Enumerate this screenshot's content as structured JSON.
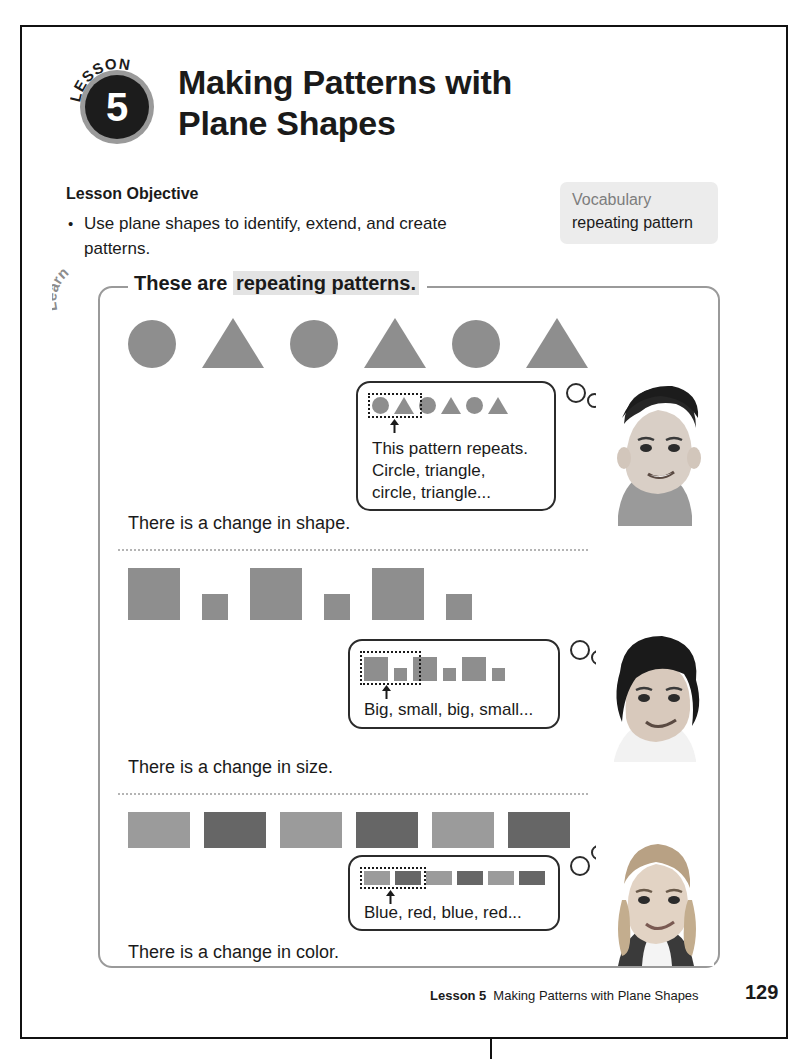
{
  "page": {
    "number": "129",
    "footer_lesson": "Lesson 5",
    "footer_title": "Making Patterns with Plane Shapes"
  },
  "header": {
    "badge_word": "LESSON",
    "badge_number": "5",
    "title_line1": "Making Patterns with",
    "title_line2": "Plane Shapes"
  },
  "objective": {
    "heading": "Lesson Objective",
    "bullet": "•",
    "text": "Use plane shapes to identify, extend, and create patterns."
  },
  "vocabulary": {
    "title": "Vocabulary",
    "term": "repeating pattern"
  },
  "learn": {
    "tab_label": "Learn",
    "heading_plain": "These are ",
    "heading_highlight": "repeating patterns."
  },
  "patterns": [
    {
      "id": "shape-pattern",
      "sequence": [
        "circle",
        "triangle",
        "circle",
        "triangle",
        "circle",
        "triangle"
      ],
      "caption": "There is a change in shape.",
      "bubble_lines": [
        "This pattern repeats.",
        "Circle, triangle,",
        "circle, triangle..."
      ],
      "mini_sequence": [
        "circle",
        "triangle",
        "circle",
        "triangle",
        "circle",
        "triangle"
      ],
      "unit_count": 2
    },
    {
      "id": "size-pattern",
      "sequence": [
        "big",
        "small",
        "big",
        "small",
        "big",
        "small"
      ],
      "caption": "There is a change in size.",
      "bubble_lines": [
        "Big, small, big, small..."
      ],
      "mini_sequence": [
        "big",
        "small",
        "big",
        "small",
        "big",
        "small"
      ],
      "unit_count": 2
    },
    {
      "id": "color-pattern",
      "sequence": [
        "blue",
        "red",
        "blue",
        "red",
        "blue",
        "red"
      ],
      "caption": "There is a change in color.",
      "bubble_lines": [
        "Blue, red, blue, red..."
      ],
      "mini_sequence": [
        "blue",
        "red",
        "blue",
        "red",
        "blue",
        "red"
      ],
      "unit_count": 2
    }
  ],
  "colors": {
    "shape_gray": "#8e8e8e",
    "blue_swatch": "#9b9b9b",
    "red_swatch": "#666666",
    "panel_border": "#9a9a9a",
    "highlight": "#e3e3e3",
    "vocab_bg": "#ececec"
  }
}
